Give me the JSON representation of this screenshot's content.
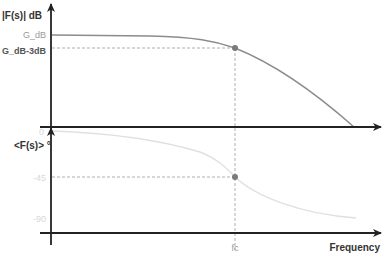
{
  "diagram": {
    "type": "bode_plot",
    "magnitude_panel": {
      "y_axis_label": "|F(s)| dB",
      "ticks": [
        {
          "label": "G_dB",
          "role": "passband gain"
        },
        {
          "label": "G_dB-3dB",
          "role": "cutoff gain"
        }
      ],
      "curve_color": "#8c8c8c",
      "marker_color": "#7a7a7a"
    },
    "phase_panel": {
      "y_axis_label": "<F(s)> °",
      "ticks": [
        {
          "label": "0"
        },
        {
          "label": "-45"
        },
        {
          "label": "-90"
        }
      ],
      "curve_color": "#e0e0e0",
      "marker_color": "#7a7a7a"
    },
    "x_axis": {
      "label": "Frequency",
      "marker_label": "fc"
    },
    "colors": {
      "axis": "#222222",
      "guide": "#9a9a9a"
    }
  }
}
